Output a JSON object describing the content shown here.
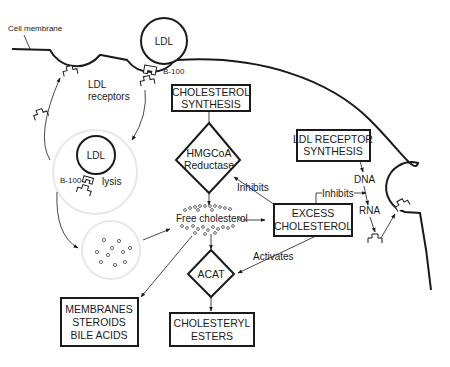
{
  "diagram": {
    "labels": {
      "cell_membrane": "Cell membrane",
      "ldl_top": "LDL",
      "b100_top": "B-100",
      "ldl_receptors_line1": "LDL",
      "ldl_receptors_line2": "receptors",
      "ldl_vesicle": "LDL",
      "b100_vesicle": "B-100",
      "lysis": "lysis",
      "free_cholesterol": "Free cholesterol",
      "inhibits_hmg": "Inhibits",
      "inhibits_dna": "Inhibits",
      "activates": "Activates",
      "dna": "DNA",
      "rna": "RNA"
    },
    "boxes": {
      "cholesterol_synthesis": [
        "CHOLESTEROL",
        "SYNTHESIS"
      ],
      "ldl_receptor_synthesis": [
        "LDL RECEPTOR",
        "SYNTHESIS"
      ],
      "excess_cholesterol": [
        "EXCESS",
        "CHOLESTEROL"
      ],
      "membranes": [
        "MEMBRANES",
        "STEROIDS",
        "BILE ACIDS"
      ],
      "cholesteryl_esters": [
        "CHOLESTERYL",
        "ESTERS"
      ]
    },
    "diamonds": {
      "hmgcoa": [
        "HMGCoA",
        "Reductase"
      ],
      "acat": [
        "ACAT"
      ]
    },
    "colors": {
      "ink": "#1a1a1a",
      "faint_circle": "#e8e8e8",
      "background": "#ffffff"
    }
  }
}
